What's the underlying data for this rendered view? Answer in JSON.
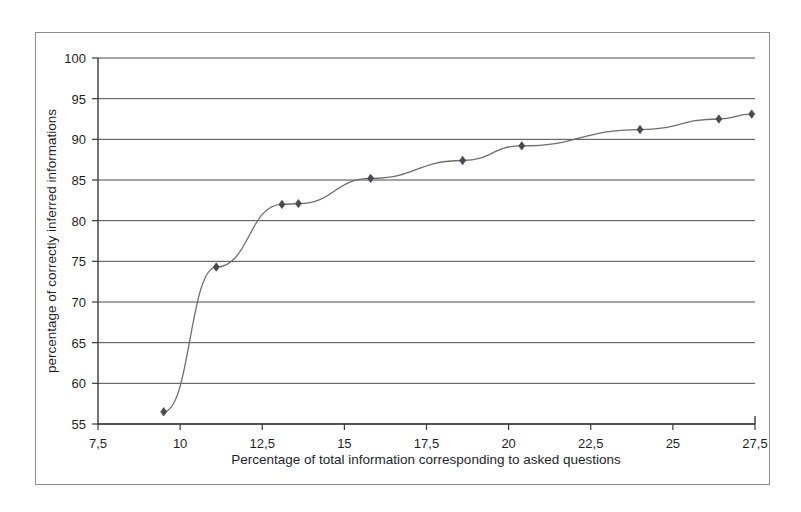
{
  "chart_data": {
    "type": "line",
    "title": "",
    "xlabel": "Percentage of total information corresponding to asked questions",
    "ylabel": "percentage of correctly inferred informations",
    "xlim": [
      7.5,
      27.5
    ],
    "ylim": [
      55,
      100
    ],
    "grid": true,
    "legend": "none",
    "decimal_separator": ",",
    "xticks": [
      7.5,
      10,
      12.5,
      15,
      17.5,
      20,
      22.5,
      25,
      27.5
    ],
    "xtick_labels": [
      "7,5",
      "10",
      "12,5",
      "15",
      "17,5",
      "20",
      "22,5",
      "25",
      "27,5"
    ],
    "yticks": [
      55,
      60,
      65,
      70,
      75,
      80,
      85,
      90,
      95,
      100
    ],
    "ytick_labels": [
      "55",
      "60",
      "65",
      "70",
      "75",
      "80",
      "85",
      "90",
      "95",
      "100"
    ],
    "marker": "diamond",
    "marker_color": "#4a4a52",
    "line_color": "#6e6e6e",
    "series": [
      {
        "name": "inference accuracy",
        "x": [
          9.5,
          11.1,
          13.1,
          13.6,
          15.8,
          18.6,
          20.4,
          24.0,
          26.4,
          27.4
        ],
        "y": [
          56.5,
          74.3,
          82.0,
          82.1,
          85.2,
          87.4,
          89.2,
          91.2,
          92.5,
          93.1
        ]
      }
    ]
  },
  "figure": {
    "background_color": "#ffffff",
    "frame_color": "#8d8d8d"
  }
}
